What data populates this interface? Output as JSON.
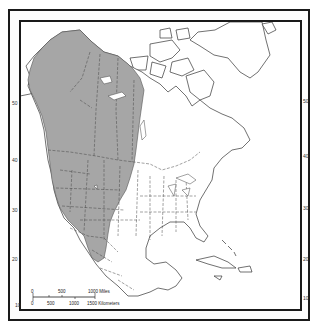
{
  "map": {
    "region": "North America",
    "range_fill_color": "#a6a6a6",
    "land_stroke_color": "#333333",
    "frame_color": "#1a1a1a",
    "latitude_labels_left": [
      "50",
      "40",
      "30",
      "20",
      "10"
    ],
    "latitude_labels_right": [
      "50",
      "40",
      "30",
      "20",
      "10"
    ],
    "scale_bar": {
      "miles_labels": [
        "0",
        "500",
        "1000 Miles"
      ],
      "km_labels": [
        "0",
        "500",
        "1000",
        "1500 Kilometers"
      ]
    }
  }
}
